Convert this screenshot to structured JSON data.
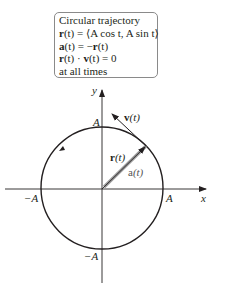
{
  "infobox": {
    "title": "Circular trajectory",
    "line1": {
      "lhs": "r",
      "rest": "(t) = ⟨A cos t, A sin t⟩"
    },
    "line2": {
      "lhs": "a",
      "rest": "(t) = −",
      "rhs": "r",
      "tail": "(t)"
    },
    "line3": {
      "lhs": "r",
      "mid": "(t) · ",
      "rhs": "v",
      "tail": "(t) = 0"
    },
    "line4": "at all times"
  },
  "axes": {
    "x_label": "x",
    "y_label": "y",
    "x_pos_tick": "A",
    "x_neg_tick": "−A",
    "y_pos_tick": "A",
    "y_neg_tick": "−A"
  },
  "vectors": {
    "velocity": {
      "bold": "v",
      "rest": "(t)"
    },
    "position": {
      "bold": "r",
      "rest": "(t)"
    },
    "acceleration": {
      "bold": "a",
      "rest": "(t)"
    }
  },
  "colors": {
    "ink": "#231f20",
    "box_border": "#8a8a8a",
    "acceleration_vector": "#9a9a9a"
  }
}
